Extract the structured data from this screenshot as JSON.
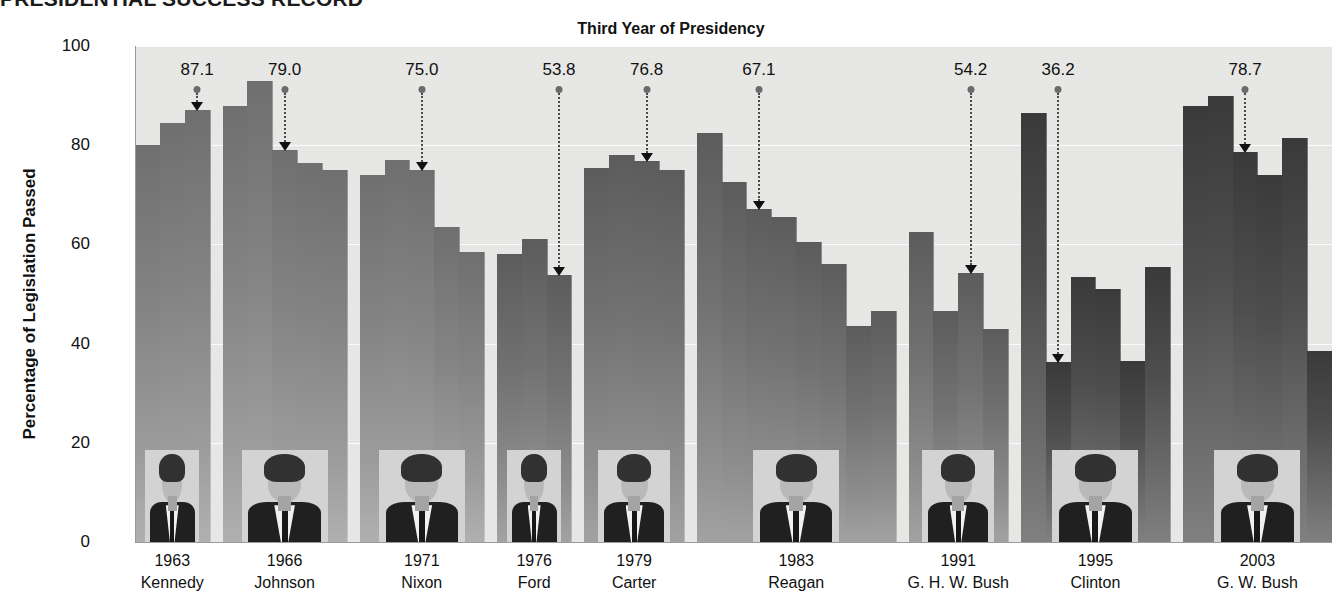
{
  "headline": "PRESIDENTIAL SUCCESS RECORD",
  "chart_data": {
    "type": "bar",
    "title": "Third Year of Presidency",
    "xlabel": "",
    "ylabel": "Percentage of Legislation Passed",
    "ylim": [
      0,
      100
    ],
    "yticks": [
      0,
      20,
      40,
      60,
      80,
      100
    ],
    "grid": true,
    "legend": "none",
    "categories": [
      "Kennedy",
      "Johnson",
      "Nixon",
      "Ford",
      "Carter",
      "Reagan",
      "G. H. W. Bush",
      "Clinton",
      "G. W. Bush"
    ],
    "groups": [
      {
        "name": "Kennedy",
        "year_label": "1963",
        "shade": "light",
        "values": [
          80.0,
          84.5,
          87.1
        ],
        "highlight_index": 2,
        "highlight_value": "87.1"
      },
      {
        "name": "Johnson",
        "year_label": "1966",
        "shade": "light",
        "values": [
          88.0,
          93.0,
          79.0,
          76.5,
          75.0
        ],
        "highlight_index": 2,
        "highlight_value": "79.0"
      },
      {
        "name": "Nixon",
        "year_label": "1971",
        "shade": "light",
        "values": [
          74.0,
          77.0,
          75.0,
          63.5,
          58.5
        ],
        "highlight_index": 2,
        "highlight_value": "75.0"
      },
      {
        "name": "Ford",
        "year_label": "1976",
        "shade": "mid",
        "values": [
          58.0,
          61.0,
          53.8
        ],
        "highlight_index": 2,
        "highlight_value": "53.8"
      },
      {
        "name": "Carter",
        "year_label": "1979",
        "shade": "mid",
        "values": [
          75.5,
          78.0,
          76.8,
          75.0
        ],
        "highlight_index": 2,
        "highlight_value": "76.8"
      },
      {
        "name": "Reagan",
        "year_label": "1983",
        "shade": "mid",
        "values": [
          82.5,
          72.5,
          67.1,
          65.5,
          60.5,
          56.0,
          43.5,
          46.5
        ],
        "highlight_index": 2,
        "highlight_value": "67.1"
      },
      {
        "name": "G. H. W. Bush",
        "year_label": "1991",
        "shade": "mid",
        "values": [
          62.5,
          46.5,
          54.2,
          43.0
        ],
        "highlight_index": 2,
        "highlight_value": "54.2"
      },
      {
        "name": "Clinton",
        "year_label": "1995",
        "shade": "dark",
        "values": [
          86.5,
          36.2,
          53.5,
          51.0,
          36.5,
          55.5
        ],
        "highlight_index": 1,
        "highlight_value": "36.2"
      },
      {
        "name": "G. W. Bush",
        "year_label": "2003",
        "shade": "dark",
        "values": [
          88.0,
          90.0,
          78.7,
          74.0,
          81.5,
          38.5
        ],
        "highlight_index": 2,
        "highlight_value": "78.7"
      }
    ],
    "annotations": [
      {
        "label": "87.1",
        "group": "Kennedy"
      },
      {
        "label": "79.0",
        "group": "Johnson"
      },
      {
        "label": "75.0",
        "group": "Nixon"
      },
      {
        "label": "53.8",
        "group": "Ford"
      },
      {
        "label": "76.8",
        "group": "Carter"
      },
      {
        "label": "67.1",
        "group": "Reagan"
      },
      {
        "label": "54.2",
        "group": "G. H. W. Bush"
      },
      {
        "label": "36.2",
        "group": "Clinton"
      },
      {
        "label": "78.7",
        "group": "G. W. Bush"
      }
    ]
  },
  "colors": {
    "plot_background": "#e8e8e6",
    "bar_light": "#8a8a8a",
    "bar_mid": "#747474",
    "bar_dark": "#464646",
    "gridline": "#ffffff",
    "text": "#111111"
  }
}
